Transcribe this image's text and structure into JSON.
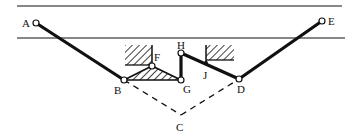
{
  "diagram": {
    "type": "mechanism-linkage",
    "colors": {
      "ink": "#111111",
      "background": "#ffffff"
    },
    "rails": [
      {
        "id": "upper-rail",
        "x1": 17,
        "y1": 6,
        "x2": 342,
        "y2": 6
      },
      {
        "id": "lower-rail",
        "x1": 17,
        "y1": 38,
        "x2": 345,
        "y2": 38
      }
    ],
    "points": {
      "A": {
        "x": 36,
        "y": 23,
        "label": "A",
        "lx": 22,
        "ly": 27
      },
      "B": {
        "x": 124,
        "y": 80,
        "label": "B",
        "lx": 114,
        "ly": 94
      },
      "C": {
        "x": 181,
        "y": 115,
        "label": "C",
        "lx": 176,
        "ly": 131
      },
      "D": {
        "x": 239,
        "y": 79,
        "label": "D",
        "lx": 237,
        "ly": 93
      },
      "E": {
        "x": 322,
        "y": 21,
        "label": "E",
        "lx": 328,
        "ly": 25
      },
      "F": {
        "x": 152,
        "y": 66,
        "label": "F",
        "lx": 154,
        "ly": 61
      },
      "G": {
        "x": 181,
        "y": 80,
        "label": "G",
        "lx": 183,
        "ly": 93
      },
      "H": {
        "x": 181,
        "y": 53,
        "label": "H",
        "lx": 177,
        "ly": 49
      },
      "J": {
        "x": 206,
        "y": 63,
        "label": "J",
        "lx": 203,
        "ly": 79
      }
    },
    "links": [
      {
        "id": "link-AB",
        "from": "A",
        "to": "B",
        "style": "solid-thick"
      },
      {
        "id": "link-GH",
        "from": "G",
        "to": "H",
        "style": "solid-thick"
      },
      {
        "id": "link-HD",
        "from": "H",
        "to": "D",
        "style": "solid-thick"
      },
      {
        "id": "link-DE",
        "from": "D",
        "to": "E",
        "style": "solid-thick"
      },
      {
        "id": "construction-BC",
        "from": "B",
        "to": "C",
        "style": "dashed"
      },
      {
        "id": "construction-CD",
        "from": "C",
        "to": "D",
        "style": "dashed"
      }
    ],
    "triangle_link": {
      "id": "triangle-BFG",
      "vertices": [
        "B",
        "F",
        "G"
      ],
      "fill": "hatched"
    },
    "ground_blocks": [
      {
        "id": "ground-left",
        "x": 125,
        "y": 45,
        "w": 27,
        "h": 20,
        "pivot": "F"
      },
      {
        "id": "ground-right",
        "x": 206,
        "y": 45,
        "w": 28,
        "h": 15,
        "pivot": "J"
      }
    ]
  }
}
